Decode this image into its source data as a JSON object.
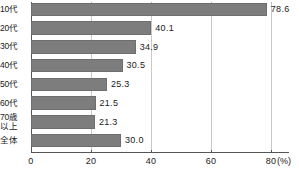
{
  "chart_data": {
    "type": "bar",
    "orientation": "horizontal",
    "title": "",
    "xlabel": "(%)",
    "ylabel": "",
    "xlim": [
      0,
      80
    ],
    "xticks": [
      0,
      20,
      40,
      60,
      80
    ],
    "xtick_labels": [
      "0",
      "20",
      "40",
      "60",
      "80"
    ],
    "grid": true,
    "grid_axis": "x",
    "legend": "none",
    "axis_unit_label": "(%)",
    "bar_color": "#7d7d7d",
    "bar_edge_color": "#6e6e6e",
    "gridline_color": "#b5b5b5",
    "axis_color": "#555555",
    "categories": [
      "10代",
      "20代",
      "30代",
      "40代",
      "50代",
      "60代",
      "70歳以上",
      "全体"
    ],
    "category_lines": [
      [
        "10代"
      ],
      [
        "20代"
      ],
      [
        "30代"
      ],
      [
        "40代"
      ],
      [
        "50代"
      ],
      [
        "60代"
      ],
      [
        "70歳",
        "以上"
      ],
      [
        "全体"
      ]
    ],
    "values": [
      78.6,
      40.1,
      34.9,
      30.5,
      25.3,
      21.5,
      21.3,
      30.0
    ],
    "value_labels": [
      "78.6",
      "40.1",
      "34.9",
      "30.5",
      "25.3",
      "21.5",
      "21.3",
      "30.0"
    ]
  }
}
